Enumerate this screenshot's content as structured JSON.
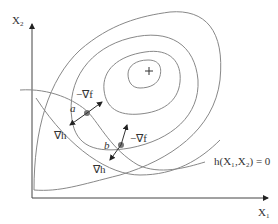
{
  "axes": {
    "x_label": "X",
    "x_sub": "1",
    "y_label": "X",
    "y_sub": "2"
  },
  "points": {
    "a": "a",
    "b": "b"
  },
  "vectors": {
    "neg_grad_f": "−∇f",
    "grad_h": "∇h"
  },
  "constraint": {
    "label": "h(X₁,X₂) = 0"
  },
  "optimum_marker": "+",
  "colors": {
    "line": "#888888",
    "axis": "#444444",
    "point": "#777777",
    "text": "#333333"
  }
}
